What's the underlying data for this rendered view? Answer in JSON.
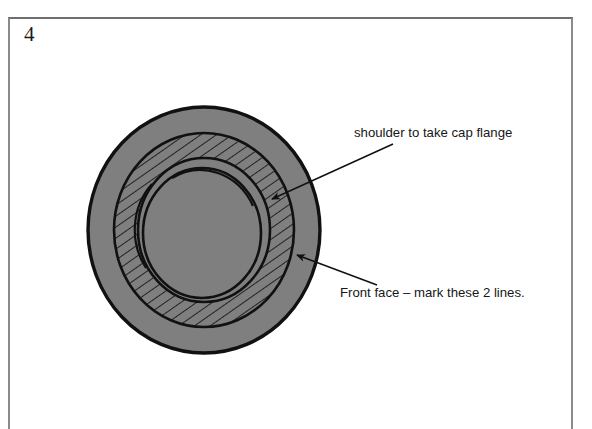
{
  "page": {
    "figure_number": "4",
    "background_color": "#ffffff",
    "border_color": "#8a8a8a"
  },
  "diagram": {
    "body_fill_color": "#7f7f7f",
    "outline_color": "#111111",
    "hatch_fill_color": "#7f7f7f",
    "hatch_line_color": "#111111",
    "parts": {
      "outer_disc": "outer-disc-face",
      "shoulder_ring": "hatched-shoulder-ring",
      "inner_bore": "inner-recess-circle",
      "inner_arc": "inner-scribed-arc"
    }
  },
  "annotations": [
    {
      "id": "shoulder-callout",
      "label": "shoulder to take cap flange",
      "text_x": 354,
      "text_y": 137,
      "line_start_x": 393,
      "line_start_y": 144,
      "line_end_x": 266,
      "line_end_y": 202,
      "arrow_at": "end"
    },
    {
      "id": "front-face-callout",
      "label": "Front face – mark these 2 lines.",
      "text_x": 340,
      "text_y": 297,
      "line_start_x": 377,
      "line_start_y": 285,
      "line_end_x": 291,
      "line_end_y": 252,
      "arrow_at": "end"
    }
  ]
}
